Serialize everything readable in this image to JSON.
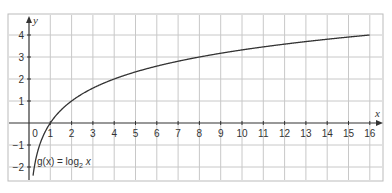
{
  "chart_data": {
    "type": "line",
    "title": "",
    "xlabel": "x",
    "ylabel": "y",
    "xlim": [
      -1,
      16.5
    ],
    "ylim": [
      -2.6,
      4.8
    ],
    "grid": true,
    "x_ticks": [
      "0",
      "1",
      "2",
      "3",
      "4",
      "5",
      "6",
      "7",
      "8",
      "9",
      "10",
      "11",
      "12",
      "13",
      "14",
      "15",
      "16"
    ],
    "y_ticks": [
      "4",
      "3",
      "2",
      "1",
      "−1",
      "−2"
    ],
    "series": [
      {
        "name": "g(x) = log2 x",
        "function": "log2(x)",
        "x": [
          0.2,
          0.25,
          0.5,
          1,
          2,
          3,
          4,
          5,
          6,
          7,
          8,
          9,
          10,
          11,
          12,
          13,
          14,
          15,
          16
        ],
        "values": [
          -2.32,
          -2,
          -1,
          0,
          1,
          1.58,
          2,
          2.32,
          2.58,
          2.81,
          3,
          3.17,
          3.32,
          3.46,
          3.58,
          3.7,
          3.81,
          3.91,
          4
        ]
      }
    ],
    "annotations": [
      {
        "text_parts": [
          "g(x) = log",
          "2",
          " x"
        ],
        "position": "lower-left"
      }
    ]
  },
  "labels": {
    "x_axis": "x",
    "y_axis": "y",
    "origin": "0",
    "fn_prefix": "g(x) = log",
    "fn_sub": "2",
    "fn_suffix": " x"
  }
}
